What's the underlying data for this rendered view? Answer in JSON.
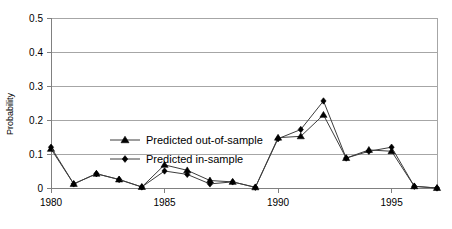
{
  "chart_data": {
    "type": "line",
    "title": "",
    "xlabel": "",
    "ylabel": "Probability",
    "ylim": [
      0,
      0.5
    ],
    "xlim": [
      1980,
      1997
    ],
    "grid": true,
    "legend_position": "inside-upper-left",
    "y_ticks": [
      "0",
      "0.1",
      "0.2",
      "0.3",
      "0.4",
      "0.5"
    ],
    "y_tick_values": [
      0,
      0.1,
      0.2,
      0.3,
      0.4,
      0.5
    ],
    "x_ticks": [
      "1980",
      "1985",
      "1990",
      "1995"
    ],
    "x_tick_values": [
      1980,
      1985,
      1990,
      1995
    ],
    "x": [
      1980,
      1981,
      1982,
      1983,
      1984,
      1985,
      1986,
      1987,
      1988,
      1989,
      1990,
      1991,
      1992,
      1993,
      1994,
      1995,
      1996,
      1997
    ],
    "series": [
      {
        "name": "Predicted out-of-sample",
        "marker": "triangle",
        "color": "#000000",
        "values": [
          0.115,
          0.012,
          0.042,
          0.025,
          0.003,
          0.068,
          0.052,
          0.022,
          0.018,
          0.002,
          0.148,
          0.152,
          0.215,
          0.088,
          0.112,
          0.108,
          0.005,
          0.0
        ]
      },
      {
        "name": "Predicted in-sample",
        "marker": "diamond",
        "color": "#000000",
        "values": [
          0.12,
          0.012,
          0.042,
          0.025,
          0.003,
          0.05,
          0.04,
          0.012,
          0.018,
          0.002,
          0.145,
          0.172,
          0.256,
          0.088,
          0.108,
          0.12,
          0.005,
          0.0
        ]
      }
    ]
  },
  "legend": {
    "items": [
      {
        "label": "Predicted out-of-sample",
        "marker": "triangle"
      },
      {
        "label": "Predicted in-sample",
        "marker": "diamond"
      }
    ]
  },
  "axes": {
    "y_title": "Probability"
  }
}
